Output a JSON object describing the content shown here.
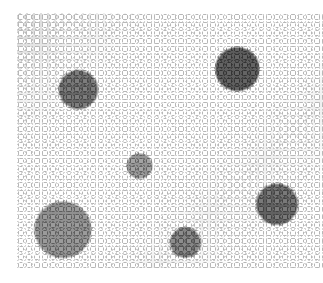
{
  "image": {
    "subject": "Dense cluster of small white alyssum flowers with dark foliage",
    "color_mode": "grayscale",
    "background": "#ffffff",
    "bounds": {
      "x": 17,
      "y": 13,
      "width": 306,
      "height": 255
    }
  }
}
